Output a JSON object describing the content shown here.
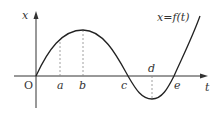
{
  "diagram": {
    "axes": {
      "vertical_label": "x",
      "horizontal_label": "t",
      "origin_label": "O"
    },
    "curve_label": "x=f(t)",
    "points": [
      {
        "label": "a",
        "note": "dashed line up to curve"
      },
      {
        "label": "b",
        "note": "dashed line up to maximum"
      },
      {
        "label": "c",
        "note": "curve crosses t-axis"
      },
      {
        "label": "d",
        "note": "dashed line down to minimum"
      },
      {
        "label": "e",
        "note": "curve crosses t-axis"
      }
    ],
    "colors": {
      "curve": "#222222",
      "axes": "#333333",
      "dashed": "#888888"
    }
  }
}
